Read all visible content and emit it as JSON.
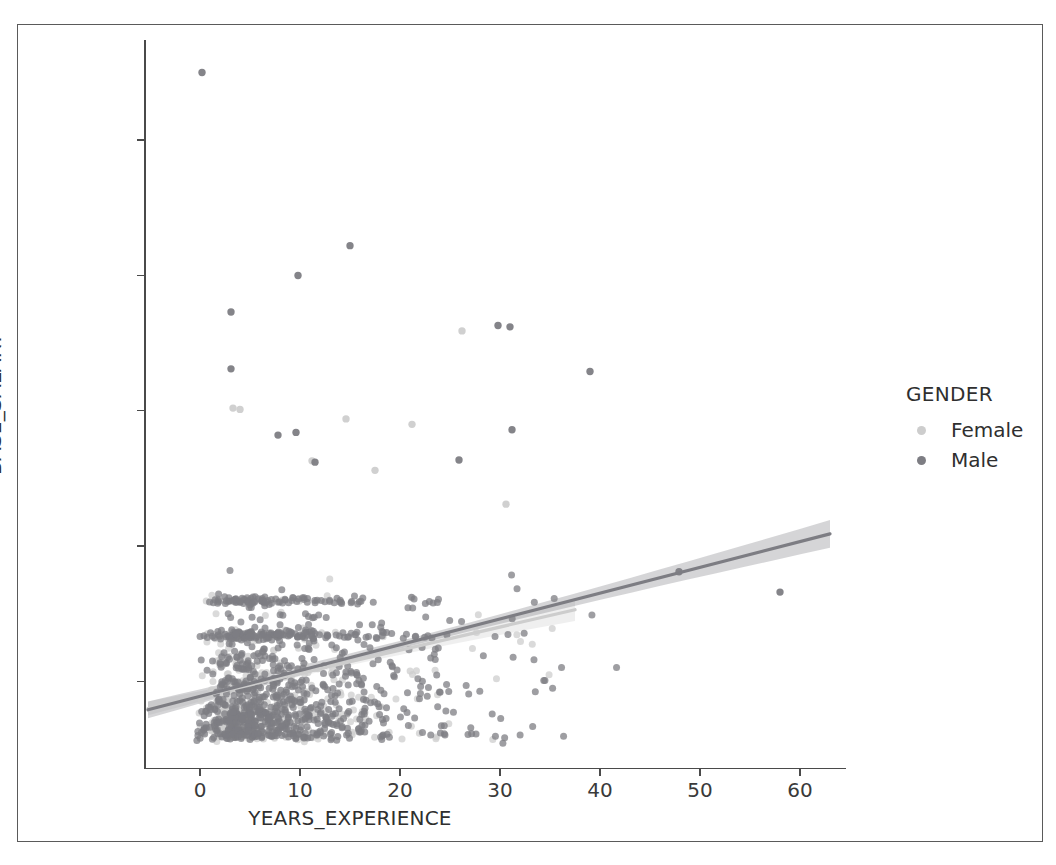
{
  "figure": {
    "background": "#ffffff",
    "frame_color": "#5a5a5a",
    "axis_color": "#4a4a4a"
  },
  "legend": {
    "title": "GENDER",
    "entries": [
      {
        "label": "Female",
        "color": "#cdcdcd"
      },
      {
        "label": "Male",
        "color": "#7d7d83"
      }
    ]
  },
  "chart_data": {
    "type": "scatter",
    "title": "",
    "xlabel": "YEARS_EXPERIENCE",
    "ylabel": "BASE_SALARY",
    "xlim": [
      -5.5,
      64.5
    ],
    "ylim": [
      18000,
      287000
    ],
    "xticks": [
      0,
      10,
      20,
      30,
      40,
      50,
      60
    ],
    "xticklabels": [
      "0",
      "10",
      "20",
      "30",
      "40",
      "50",
      "60"
    ],
    "yticks": [
      50000,
      100000,
      150000,
      200000,
      250000
    ],
    "yticklabels": [
      "50000",
      "100000",
      "150000",
      "200000",
      "250000"
    ],
    "grid": false,
    "legend_position": "right",
    "marker_size": 7,
    "marker_alpha": 0.75,
    "series": [
      {
        "name": "Female",
        "color": "#cdcdcd",
        "n_points": 430,
        "regression": {
          "x": [
            -5.2,
            37.5
          ],
          "y": [
            40000,
            76500
          ],
          "slope": 855,
          "intercept": 44500,
          "band_halfwidth": 2600
        },
        "cluster": {
          "x_peak": 3.0,
          "x_decay": 9.5,
          "x_max": 40.0,
          "y_base": 30000,
          "y_scale": 16000,
          "y_max": 180000,
          "salary_bands": [
            {
              "value": 67000,
              "weight": 0.06
            },
            {
              "value": 80000,
              "weight": 0.04
            },
            {
              "value": 30000,
              "weight": 0.12
            }
          ]
        },
        "outliers": [
          {
            "x": 3.3,
            "y": 151000
          },
          {
            "x": 4.0,
            "y": 150500
          },
          {
            "x": 14.6,
            "y": 147000
          },
          {
            "x": 11.2,
            "y": 131500
          },
          {
            "x": 26.2,
            "y": 179500
          },
          {
            "x": 21.2,
            "y": 145000
          },
          {
            "x": 17.5,
            "y": 128000
          },
          {
            "x": 30.6,
            "y": 115500
          }
        ]
      },
      {
        "name": "Male",
        "color": "#7d7d83",
        "n_points": 980,
        "regression": {
          "x": [
            -5.2,
            63.0
          ],
          "y": [
            39500,
            104500
          ],
          "slope": 1115,
          "intercept": 45300,
          "band_halfwidth": 3200
        },
        "cluster": {
          "x_peak": 3.5,
          "x_decay": 11.0,
          "x_max": 42.0,
          "y_base": 30000,
          "y_scale": 18500,
          "y_max": 215000,
          "salary_bands": [
            {
              "value": 67000,
              "weight": 0.13
            },
            {
              "value": 80000,
              "weight": 0.09
            },
            {
              "value": 30000,
              "weight": 0.11
            }
          ]
        },
        "outliers": [
          {
            "x": 0.2,
            "y": 275000
          },
          {
            "x": 15.0,
            "y": 211000
          },
          {
            "x": 9.8,
            "y": 200000
          },
          {
            "x": 3.1,
            "y": 186500
          },
          {
            "x": 29.8,
            "y": 181500
          },
          {
            "x": 31.0,
            "y": 181000
          },
          {
            "x": 3.1,
            "y": 165500
          },
          {
            "x": 39.0,
            "y": 164500
          },
          {
            "x": 31.2,
            "y": 143000
          },
          {
            "x": 9.6,
            "y": 142000
          },
          {
            "x": 7.8,
            "y": 141000
          },
          {
            "x": 25.9,
            "y": 131800
          },
          {
            "x": 11.5,
            "y": 131000
          },
          {
            "x": 47.9,
            "y": 90500
          },
          {
            "x": 58.0,
            "y": 83000
          }
        ]
      }
    ]
  }
}
